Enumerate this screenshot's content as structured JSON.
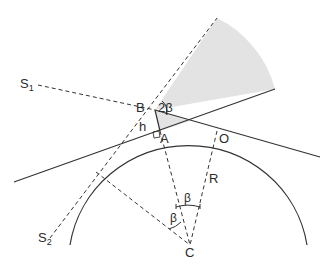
{
  "diagram": {
    "type": "geometry",
    "labels": {
      "S1": {
        "main": "S",
        "sub": "1"
      },
      "S2": {
        "main": "S",
        "sub": "2"
      },
      "B": "B",
      "A": "A",
      "O": "O",
      "C": "C",
      "R": "R",
      "h": "h",
      "angle_2beta": "2β",
      "angle_beta_top": "β",
      "angle_beta_left": "β"
    },
    "colors": {
      "line": "#333333",
      "shaded_sector": "#e3e3e3",
      "background": "#ffffff"
    }
  }
}
